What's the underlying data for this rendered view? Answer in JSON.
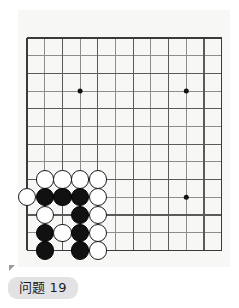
{
  "app": {
    "kind": "go-problem-diagram",
    "background_color": "#ffffff"
  },
  "board": {
    "name": "go-board",
    "board_background_color": "#f7f7f6",
    "line_color": "#3a3a3a",
    "thin_line_color": "#8d8d8d",
    "columns": 12,
    "rows": 13,
    "origin_x": 9,
    "origin_y": 28,
    "spacing": 17.7,
    "star_points": [
      {
        "col": 4,
        "row": 4
      },
      {
        "col": 10,
        "row": 4
      },
      {
        "col": 10,
        "row": 10
      }
    ],
    "black_color": "#111111",
    "white_color": "#ffffff",
    "stone_radius": 9.2,
    "stones": [
      {
        "color": "white",
        "col": 2,
        "row": 9
      },
      {
        "color": "white",
        "col": 3,
        "row": 9
      },
      {
        "color": "white",
        "col": 4,
        "row": 9
      },
      {
        "color": "white",
        "col": 5,
        "row": 9
      },
      {
        "color": "white",
        "col": 1,
        "row": 10
      },
      {
        "color": "black",
        "col": 2,
        "row": 10
      },
      {
        "color": "black",
        "col": 3,
        "row": 10
      },
      {
        "color": "black",
        "col": 4,
        "row": 10
      },
      {
        "color": "white",
        "col": 5,
        "row": 10
      },
      {
        "color": "white",
        "col": 2,
        "row": 11
      },
      {
        "color": "black",
        "col": 4,
        "row": 11
      },
      {
        "color": "white",
        "col": 5,
        "row": 11
      },
      {
        "color": "black",
        "col": 2,
        "row": 12
      },
      {
        "color": "white",
        "col": 3,
        "row": 12
      },
      {
        "color": "black",
        "col": 4,
        "row": 12
      },
      {
        "color": "white",
        "col": 5,
        "row": 12
      },
      {
        "color": "black",
        "col": 2,
        "row": 13
      },
      {
        "color": "black",
        "col": 4,
        "row": 13
      },
      {
        "color": "white",
        "col": 5,
        "row": 13
      }
    ]
  },
  "caption": {
    "label": "问题",
    "number": "19",
    "badge_color": "#e2e2e4",
    "text_color": "#1c1c1c"
  }
}
